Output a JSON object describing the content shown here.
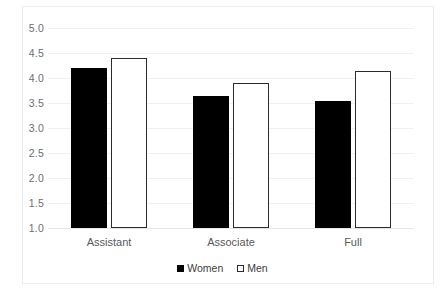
{
  "chart_data": {
    "type": "bar",
    "title": "",
    "subtitle": "",
    "xlabel": "",
    "ylabel": "",
    "categories": [
      "Assistant",
      "Associate",
      "Full"
    ],
    "series": [
      {
        "name": "Women",
        "values": [
          4.2,
          3.65,
          3.55
        ],
        "color": "#000000",
        "style": "filled"
      },
      {
        "name": "Men",
        "values": [
          4.4,
          3.9,
          4.15
        ],
        "color": "#ffffff",
        "style": "outlined"
      }
    ],
    "ylim": [
      1.0,
      5.0
    ],
    "ytick_step": 0.5,
    "yticks": [
      "5.0",
      "4.5",
      "4.0",
      "3.5",
      "3.0",
      "2.5",
      "2.0",
      "1.5",
      "1.0"
    ],
    "ytick_values": [
      5.0,
      4.5,
      4.0,
      3.5,
      3.0,
      2.5,
      2.0,
      1.5,
      1.0
    ],
    "grid": true,
    "grid_axis": "y",
    "legend_position": "bottom",
    "legend": [
      "Women",
      "Men"
    ],
    "colors": {
      "women_fill": "#000000",
      "men_fill": "#ffffff",
      "bar_outline": "#2b2b2b",
      "gridline": "#f0f0f1",
      "axis_text": "#6d6e71",
      "category_text": "#58595b",
      "background": "#ffffff",
      "frame": "#ececed"
    }
  }
}
